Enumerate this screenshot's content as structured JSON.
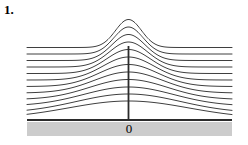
{
  "figure": {
    "problem_number": "1.",
    "origin_label": "0",
    "caption": ""
  },
  "style": {
    "curve_color": "#3f3f3f",
    "axis_color": "#2b2b2b",
    "vertical_line_color": "#2b2b2b",
    "shadow_band_color": "#cccccc",
    "background_color": "#ffffff",
    "curve_stroke_width": 1,
    "axis_stroke_width": 2.2,
    "vertical_stroke_width": 1.8
  },
  "chart_data": {
    "type": "line",
    "title": "",
    "subtitle": "",
    "xlabel": "",
    "ylabel": "",
    "annotations": [
      "0"
    ],
    "legend": [],
    "legend_position": "none",
    "grid": false,
    "xlim": [
      -1,
      1
    ],
    "ylim": [
      0,
      1
    ],
    "axis_y_pixel": 120,
    "x_origin_pixel": 128.5,
    "x_left_pixel": 27,
    "x_right_pixel": 232,
    "series": [
      {
        "name": "curve-1",
        "peak_y_pixel": 101.0,
        "sigma_pixel": 60.0,
        "baseline_y_pixel": 118.5
      },
      {
        "name": "curve-2",
        "peak_y_pixel": 94.0,
        "sigma_pixel": 52.0,
        "baseline_y_pixel": 113.0
      },
      {
        "name": "curve-3",
        "peak_y_pixel": 87.0,
        "sigma_pixel": 45.0,
        "baseline_y_pixel": 106.0
      },
      {
        "name": "curve-4",
        "peak_y_pixel": 79.5,
        "sigma_pixel": 39.0,
        "baseline_y_pixel": 99.5
      },
      {
        "name": "curve-5",
        "peak_y_pixel": 72.0,
        "sigma_pixel": 34.0,
        "baseline_y_pixel": 93.0
      },
      {
        "name": "curve-6",
        "peak_y_pixel": 64.5,
        "sigma_pixel": 29.5,
        "baseline_y_pixel": 86.5
      },
      {
        "name": "curve-7",
        "peak_y_pixel": 57.0,
        "sigma_pixel": 25.5,
        "baseline_y_pixel": 80.0
      },
      {
        "name": "curve-8",
        "peak_y_pixel": 49.5,
        "sigma_pixel": 22.0,
        "baseline_y_pixel": 73.5
      },
      {
        "name": "curve-9",
        "peak_y_pixel": 42.0,
        "sigma_pixel": 19.0,
        "baseline_y_pixel": 67.0
      },
      {
        "name": "curve-10",
        "peak_y_pixel": 34.5,
        "sigma_pixel": 16.5,
        "baseline_y_pixel": 60.5
      },
      {
        "name": "curve-11",
        "peak_y_pixel": 27.0,
        "sigma_pixel": 14.5,
        "baseline_y_pixel": 54.0
      },
      {
        "name": "curve-12",
        "peak_y_pixel": 19.5,
        "sigma_pixel": 13.0,
        "baseline_y_pixel": 47.5
      }
    ],
    "vertical_marker": {
      "x_pixel": 128.5,
      "top_y_pixel": 46.0,
      "bottom_y_pixel": 120.0
    }
  }
}
